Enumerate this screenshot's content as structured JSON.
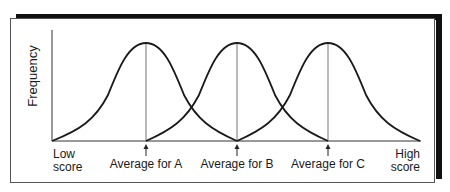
{
  "diagram": {
    "y_axis_label": "Frequency",
    "x_axis_low_label_line1": "Low",
    "x_axis_low_label_line2": "score",
    "x_axis_high_label_line1": "High",
    "x_axis_high_label_line2": "score",
    "averages": [
      {
        "label": "Average for A"
      },
      {
        "label": "Average for B"
      },
      {
        "label": "Average for C"
      }
    ],
    "curves": [
      "A",
      "B",
      "C"
    ],
    "colors": {
      "curve": "#1a1a1a",
      "mean_line": "#777777",
      "frame_shadow": "#111111",
      "axis": "#333333"
    }
  }
}
